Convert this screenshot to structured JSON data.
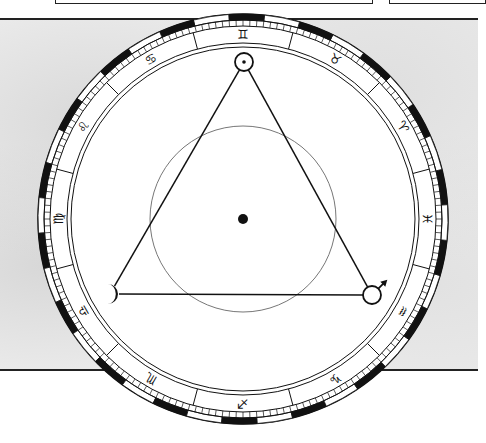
{
  "page": {
    "width": 478,
    "height": 443,
    "colors": {
      "ink": "#111111",
      "paper": "#ffffff",
      "texture": "#ececec"
    }
  },
  "top_boxes": [
    {
      "left": 55,
      "width": 316
    },
    {
      "left": 389,
      "width": 95
    }
  ],
  "rules": [
    {
      "left": 0,
      "top": 18,
      "width": 478
    },
    {
      "left": 0,
      "top": 369,
      "width": 105
    },
    {
      "left": 380,
      "top": 369,
      "width": 98
    }
  ],
  "wheel": {
    "center": {
      "x": 243,
      "y": 219
    },
    "radii": {
      "outer": 205,
      "band_inner": 199,
      "tick_inner": 193,
      "sign_inner": 176,
      "inner_line": 172,
      "center_circle": 93,
      "center_dot": 5
    },
    "band_segment_deg": 10,
    "band_offset_deg": 4,
    "tick_deg": 2,
    "signs": [
      {
        "name": "gemini",
        "glyph": "♊︎",
        "angle": 90
      },
      {
        "name": "taurus",
        "glyph": "♉︎",
        "angle": 60
      },
      {
        "name": "aries",
        "glyph": "♈︎",
        "angle": 30
      },
      {
        "name": "pisces",
        "glyph": "♓︎",
        "angle": 0
      },
      {
        "name": "aquarius",
        "glyph": "♒︎",
        "angle": -30
      },
      {
        "name": "capricorn",
        "glyph": "♑︎",
        "angle": -60
      },
      {
        "name": "sagittarius",
        "glyph": "♐︎",
        "angle": -90
      },
      {
        "name": "scorpio",
        "glyph": "♏︎",
        "angle": -120
      },
      {
        "name": "libra",
        "glyph": "♎︎",
        "angle": -150
      },
      {
        "name": "virgo",
        "glyph": "♍︎",
        "angle": 180
      },
      {
        "name": "leo",
        "glyph": "♌︎",
        "angle": 150
      },
      {
        "name": "cancer",
        "glyph": "♋︎",
        "angle": 120
      }
    ],
    "planets": [
      {
        "name": "sun",
        "symbol": "sun",
        "x": 244,
        "y": 62,
        "r": 9
      },
      {
        "name": "moon",
        "symbol": "moon",
        "x": 110,
        "y": 294,
        "r": 9
      },
      {
        "name": "mars",
        "symbol": "mars",
        "x": 372,
        "y": 295,
        "r": 9
      }
    ],
    "aspect_lines": [
      {
        "from": "sun",
        "to": "moon"
      },
      {
        "from": "sun",
        "to": "mars"
      },
      {
        "from": "moon",
        "to": "mars"
      }
    ]
  }
}
